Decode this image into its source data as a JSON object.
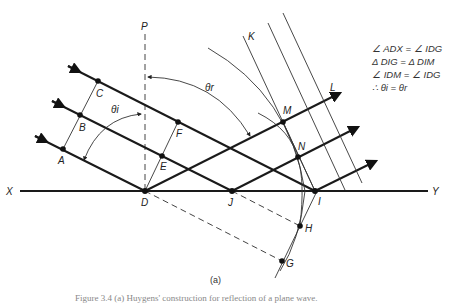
{
  "diagram": {
    "axis_labels": {
      "left": "X",
      "right": "Y",
      "normal": "P"
    },
    "points": {
      "A": "A",
      "B": "B",
      "C": "C",
      "D": "D",
      "E": "E",
      "F": "F",
      "G": "G",
      "H": "H",
      "I": "I",
      "J": "J",
      "K": "K",
      "L": "L",
      "M": "M",
      "N": "N"
    },
    "angles": {
      "incidence": "θi",
      "reflection": "θr"
    },
    "equations": [
      "∠ ADX = ∠ IDG",
      "Δ DIG = Δ DIM",
      "∠ IDM = ∠ IDG",
      "∴ θi = θr"
    ],
    "subfigure_label": "(a)",
    "caption": "Figure 3.4 (a) Huygens' construction for reflection of a plane wave."
  }
}
